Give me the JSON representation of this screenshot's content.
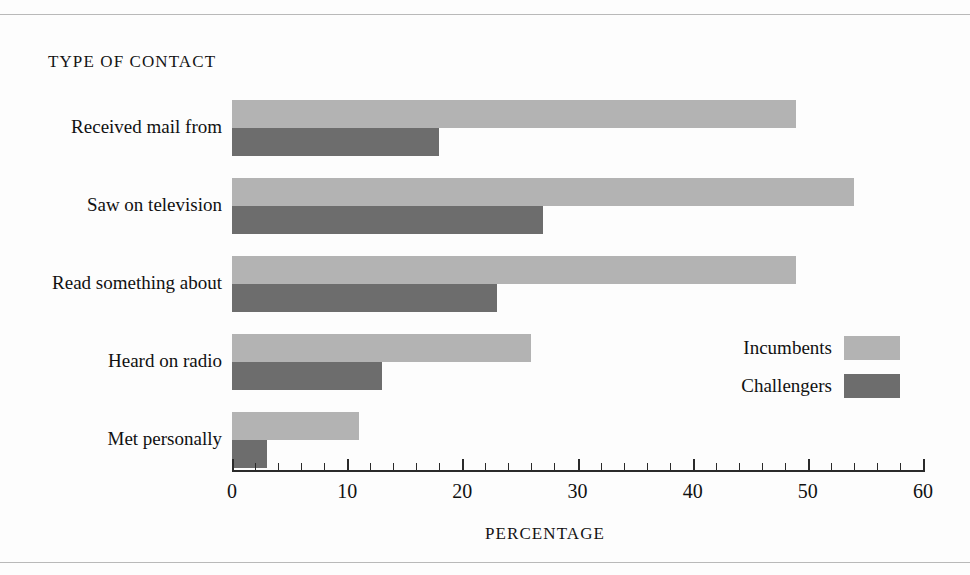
{
  "chart_data": {
    "type": "bar",
    "orientation": "horizontal",
    "title": "TYPE OF CONTACT",
    "xlabel": "PERCENTAGE",
    "ylabel": "",
    "xlim": [
      0,
      60
    ],
    "xticks": [
      0,
      10,
      20,
      30,
      40,
      50,
      60
    ],
    "xtick_labels": [
      "0",
      "10",
      "20",
      "30",
      "40",
      "50",
      "60"
    ],
    "minor_tick_step": 2,
    "grid": false,
    "legend_position": "right-middle",
    "categories": [
      "Received mail from",
      "Saw on television",
      "Read something about",
      "Heard on radio",
      "Met personally"
    ],
    "series": [
      {
        "name": "Incumbents",
        "color": "#b3b3b3",
        "values": [
          49,
          54,
          49,
          26,
          11
        ]
      },
      {
        "name": "Challengers",
        "color": "#6d6d6d",
        "values": [
          18,
          27,
          23,
          13,
          3
        ]
      }
    ]
  },
  "legend": {
    "entries": [
      {
        "label": "Incumbents",
        "color": "#b3b3b3"
      },
      {
        "label": "Challengers",
        "color": "#6d6d6d"
      }
    ]
  },
  "colors": {
    "incumbents": "#b3b3b3",
    "challengers": "#6d6d6d",
    "axis": "#2a2a2a",
    "rule": "#b9b9b9",
    "text": "#111111"
  }
}
